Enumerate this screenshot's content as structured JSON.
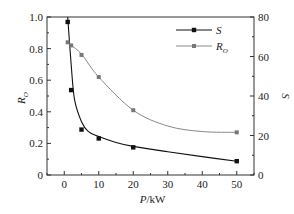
{
  "chart_data": {
    "type": "line",
    "title": "",
    "xlabel": "P/kW",
    "ylabel_left": "R_O",
    "ylabel_right": "S",
    "xlim": [
      -5,
      55
    ],
    "ylim_left": [
      0,
      1.0
    ],
    "ylim_right": [
      0,
      80
    ],
    "x_ticks": [
      0,
      10,
      20,
      30,
      40,
      50
    ],
    "y_ticks_left": [
      "0",
      "0.2",
      "0.4",
      "0.6",
      "0.8",
      "1.0"
    ],
    "y_ticks_right": [
      "0",
      "20",
      "40",
      "60",
      "80"
    ],
    "grid": false,
    "legend_position": "upper right",
    "series": [
      {
        "name": "S",
        "axis": "right",
        "color": "#111111",
        "marker": "square",
        "x": [
          1,
          2,
          5,
          10,
          20,
          50
        ],
        "values": [
          77.5,
          43,
          23,
          18.5,
          14,
          7
        ]
      },
      {
        "name": "R_O",
        "axis": "left",
        "color": "#888888",
        "marker": "square",
        "x": [
          1,
          2,
          5,
          10,
          20,
          50
        ],
        "values": [
          0.84,
          0.82,
          0.76,
          0.62,
          0.41,
          0.27
        ]
      }
    ]
  },
  "labels": {
    "xlabel_main": "P",
    "xlabel_unit": "/kW",
    "ylabel_left_main": "R",
    "ylabel_left_sub": "O",
    "ylabel_right": "S",
    "legend_s": "S",
    "legend_ro_main": "R",
    "legend_ro_sub": "O"
  }
}
